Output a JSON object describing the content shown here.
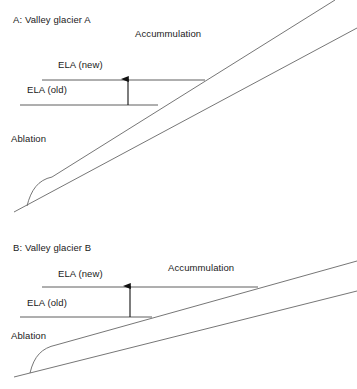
{
  "figure": {
    "background_color": "#ffffff",
    "line_color": "#555555",
    "ela_line_color": "#4d4d4d",
    "arrow_color": "#111111",
    "text_color": "#1a1a1a"
  },
  "panels": [
    {
      "id": "A",
      "title": "A: Valley glacier A",
      "accumulation_label": "Accummulation",
      "ablation_label": "Ablation",
      "ela_new_label": "ELA (new)",
      "ela_old_label": "ELA (old)",
      "slope_description": "steep",
      "geometry": {
        "ground_line": {
          "x1": 14,
          "y1": 212,
          "x2": 357,
          "y2": 28
        },
        "glacier_surface_line": {
          "x1": 27,
          "y1": 206,
          "x2": 335,
          "y2": 0
        },
        "toe_curve": {
          "x": 27,
          "y": 206,
          "cx": 33,
          "cy": 184,
          "ex": 52,
          "ey": 177
        },
        "ela_new_line": {
          "x1": 42,
          "y1": 80,
          "x2": 205,
          "y2": 80
        },
        "ela_old_line": {
          "x1": 20,
          "y1": 105,
          "x2": 158,
          "y2": 105
        },
        "arrow": {
          "x": 128,
          "y_from": 105,
          "y_to": 79
        }
      },
      "label_positions": {
        "title": {
          "x": 13,
          "y": 21
        },
        "accumulation": {
          "x": 135,
          "y": 35
        },
        "ela_new": {
          "x": 58,
          "y": 66
        },
        "ela_old": {
          "x": 27,
          "y": 91
        },
        "ablation": {
          "x": 11,
          "y": 140
        }
      }
    },
    {
      "id": "B",
      "title": "B: Valley glacier B",
      "accumulation_label": "Accummulation",
      "ablation_label": "Ablation",
      "ela_new_label": "ELA (new)",
      "ela_old_label": "ELA (old)",
      "slope_description": "gentle",
      "geometry": {
        "ground_line": {
          "x1": 14,
          "y1": 377,
          "x2": 357,
          "y2": 291
        },
        "glacier_surface_line": {
          "x1": 30,
          "y1": 373,
          "x2": 357,
          "y2": 261
        },
        "toe_curve": {
          "x": 30,
          "y": 373,
          "cx": 36,
          "cy": 350,
          "ex": 56,
          "ey": 345
        },
        "ela_new_line": {
          "x1": 42,
          "y1": 287,
          "x2": 258,
          "y2": 287
        },
        "ela_old_line": {
          "x1": 20,
          "y1": 317,
          "x2": 152,
          "y2": 317
        },
        "arrow": {
          "x": 130,
          "y_from": 317,
          "y_to": 286
        }
      },
      "label_positions": {
        "title": {
          "x": 13,
          "y": 249
        },
        "accumulation": {
          "x": 168,
          "y": 269
        },
        "ela_new": {
          "x": 58,
          "y": 275
        },
        "ela_old": {
          "x": 27,
          "y": 304
        },
        "ablation": {
          "x": 11,
          "y": 337
        }
      }
    }
  ]
}
